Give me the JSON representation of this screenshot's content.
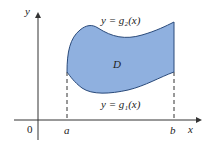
{
  "figure": {
    "region_label": "D",
    "upper_curve_label": "y = g₂(x)",
    "lower_curve_label": "y = g₁(x)",
    "x_axis_label": "x",
    "y_axis_label": "y",
    "origin_label": "0",
    "a_label": "a",
    "b_label": "b",
    "colors": {
      "fill": "#8fb0df",
      "stroke": "#2a4a7a",
      "axis": "#333333"
    }
  }
}
